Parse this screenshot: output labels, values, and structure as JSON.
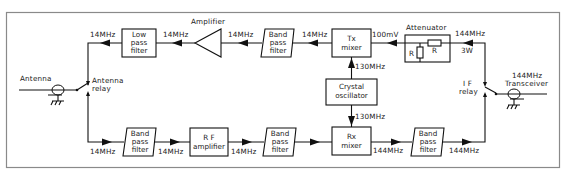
{
  "diagram": {
    "colors": {
      "line": "#111111",
      "frame": "#8a8a8a",
      "background": "#ffffff"
    },
    "ports": {
      "antenna": "Antenna",
      "antenna_relay": [
        "Antenna",
        "relay"
      ],
      "if_relay": [
        "I F",
        "relay"
      ],
      "transceiver": [
        "144MHz",
        "Transceiver"
      ]
    },
    "tx_chain": {
      "blocks": {
        "low_pass_filter": [
          "Low",
          "pass",
          "filter"
        ],
        "amplifier": "Amplifier",
        "band_pass_filter": [
          "Band",
          "pass",
          "filter"
        ],
        "tx_mixer": [
          "Tx",
          "mixer"
        ],
        "attenuator": "Attenuator",
        "attenuator_r_series": "R",
        "attenuator_r_shunt": "R"
      },
      "labels": {
        "relay_to_lpf": "14MHz",
        "lpf_to_amp": "14MHz",
        "amp_to_bpf": "14MHz",
        "bpf_to_mixer": "14MHz",
        "mixer_in": "100mV",
        "att_in_freq": "144MHz",
        "att_in_power": "3W"
      }
    },
    "local_oscillator": {
      "block": [
        "Crystal",
        "oscillator"
      ],
      "to_tx": "130MHz",
      "to_rx": "130MHz"
    },
    "rx_chain": {
      "blocks": {
        "band_pass_filter_1": [
          "Band",
          "pass",
          "filter"
        ],
        "rf_amplifier": [
          "R F",
          "amplifier"
        ],
        "band_pass_filter_2": [
          "Band",
          "pass",
          "filter"
        ],
        "rx_mixer": [
          "Rx",
          "mixer"
        ],
        "band_pass_filter_3": [
          "Band",
          "pass",
          "filter"
        ]
      },
      "labels": {
        "relay_to_bpf1": "14MHz",
        "bpf1_to_rfamp": "14MHz",
        "rfamp_to_bpf2": "14MHz",
        "mixer_to_bpf3": "144MHz",
        "bpf3_to_relay": "144MHz"
      }
    }
  }
}
